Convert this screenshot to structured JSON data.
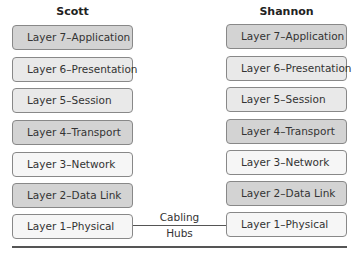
{
  "hosts": {
    "left": {
      "title": "Scott",
      "layers": [
        {
          "label": "Layer 7–Application",
          "shade": "dark"
        },
        {
          "label": "Layer 6–Presentation",
          "shade": "mid"
        },
        {
          "label": "Layer 5–Session",
          "shade": "mid"
        },
        {
          "label": "Layer 4–Transport",
          "shade": "dark"
        },
        {
          "label": "Layer 3–Network",
          "shade": "light"
        },
        {
          "label": "Layer 2–Data Link",
          "shade": "dark"
        },
        {
          "label": "Layer 1–Physical",
          "shade": "light"
        }
      ]
    },
    "right": {
      "title": "Shannon",
      "layers": [
        {
          "label": "Layer 7–Application",
          "shade": "dark"
        },
        {
          "label": "Layer 6–Presentation",
          "shade": "mid"
        },
        {
          "label": "Layer 5–Session",
          "shade": "mid"
        },
        {
          "label": "Layer 4–Transport",
          "shade": "dark"
        },
        {
          "label": "Layer 3–Network",
          "shade": "light"
        },
        {
          "label": "Layer 2–Data Link",
          "shade": "dark"
        },
        {
          "label": "Layer 1–Physical",
          "shade": "light"
        }
      ]
    }
  },
  "connector": {
    "line1": "Cabling",
    "line2": "Hubs"
  },
  "colors": {
    "dark": "#d3d3d3",
    "mid": "#e9e9e9",
    "light": "#f6f6f6",
    "border": "#888888"
  }
}
